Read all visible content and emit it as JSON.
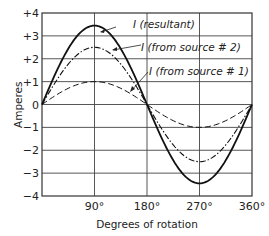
{
  "chart_data": {
    "type": "line",
    "title": "",
    "xlabel": "Degrees of rotation",
    "ylabel": "Amperes",
    "xlim": [
      0,
      360
    ],
    "ylim": [
      -4,
      4
    ],
    "grid": true,
    "x_ticks": [
      "90°",
      "180°",
      "270°",
      "360°"
    ],
    "x_tick_values": [
      90,
      180,
      270,
      360
    ],
    "y_ticks": [
      "+4",
      "+3",
      "+2",
      "+1",
      "0",
      "-1",
      "-2",
      "-3",
      "-4"
    ],
    "y_tick_values": [
      4,
      3,
      2,
      1,
      0,
      -1,
      -2,
      -3,
      -4
    ],
    "x": [
      0,
      30,
      60,
      90,
      120,
      150,
      180,
      210,
      240,
      270,
      300,
      330,
      360
    ],
    "series": [
      {
        "name": "I (resultant)",
        "style": "solid",
        "amplitude": 3.45,
        "values": [
          0,
          1.73,
          2.99,
          3.45,
          2.99,
          1.73,
          0,
          -1.73,
          -2.99,
          -3.45,
          -2.99,
          -1.73,
          0
        ]
      },
      {
        "name": "I (from source # 2)",
        "style": "dash-dot",
        "amplitude": 2.5,
        "values": [
          0,
          1.25,
          2.17,
          2.5,
          2.17,
          1.25,
          0,
          -1.25,
          -2.17,
          -2.5,
          -2.17,
          -1.25,
          0
        ]
      },
      {
        "name": "I (from source # 1)",
        "style": "dashed",
        "amplitude": 1.0,
        "values": [
          0,
          0.5,
          0.87,
          1.0,
          0.87,
          0.5,
          0,
          -0.5,
          -0.87,
          -1.0,
          -0.87,
          -0.5,
          0
        ]
      }
    ],
    "annotations": [
      {
        "text": "I (resultant)",
        "points_to": "resultant near 100°"
      },
      {
        "text": "I (from source # 2)",
        "points_to": "source #2 near 110°"
      },
      {
        "text": "I (from source # 1)",
        "points_to": "source #1 near 125°"
      }
    ],
    "legend_position": "inline annotations"
  },
  "labels": {
    "ylabel": "Amperes",
    "xlabel": "Degrees of rotation",
    "ann_resultant": "I (resultant)",
    "ann_source2": "I (from source # 2)",
    "ann_source1": "I (from source # 1)"
  }
}
